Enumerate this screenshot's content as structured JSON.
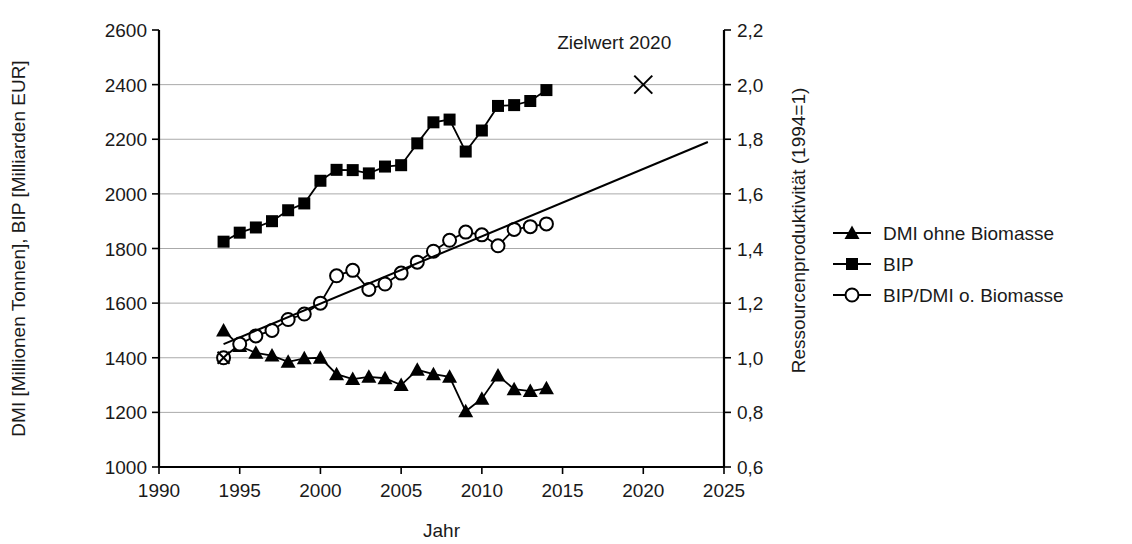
{
  "chart_data": {
    "type": "line",
    "title": "",
    "xlabel": "Jahr",
    "ylabel_left": "DMI [Millionen Tonnen], BIP [Milliarden EUR]",
    "ylabel_right": "Ressourcenproduktivität (1994=1)",
    "xlim": [
      1990,
      2025
    ],
    "xticks": [
      1990,
      1995,
      2000,
      2005,
      2010,
      2015,
      2020,
      2025
    ],
    "xtick_labels": [
      "1990",
      "1995",
      "2000",
      "2005",
      "2010",
      "2015",
      "2020",
      "2025"
    ],
    "ylim_left": [
      1000,
      2600
    ],
    "yticks_left": [
      1000,
      1200,
      1400,
      1600,
      1800,
      2000,
      2200,
      2400,
      2600
    ],
    "ytick_labels_left": [
      "1000",
      "1200",
      "1400",
      "1600",
      "1800",
      "2000",
      "2200",
      "2400",
      "2600"
    ],
    "ylim_right": [
      0.6,
      2.2
    ],
    "yticks_right": [
      0.6,
      0.8,
      1.0,
      1.2,
      1.4,
      1.6,
      1.8,
      2.0,
      2.2
    ],
    "ytick_labels_right": [
      "0,6",
      "0,8",
      "1,0",
      "1,2",
      "1,4",
      "1,6",
      "1,8",
      "2,0",
      "2,2"
    ],
    "grid": true,
    "legend_position": "right",
    "x": [
      1994,
      1995,
      1996,
      1997,
      1998,
      1999,
      2000,
      2001,
      2002,
      2003,
      2004,
      2005,
      2006,
      2007,
      2008,
      2009,
      2010,
      2011,
      2012,
      2013,
      2014
    ],
    "series": [
      {
        "name": "DMI ohne Biomasse",
        "marker": "filled-triangle",
        "axis": "left",
        "values": [
          1500,
          1443,
          1418,
          1408,
          1385,
          1398,
          1400,
          1340,
          1322,
          1330,
          1325,
          1300,
          1356,
          1340,
          1330,
          1204,
          1250,
          1335,
          1285,
          1278,
          1288
        ]
      },
      {
        "name": "BIP",
        "marker": "filled-square",
        "axis": "left",
        "values": [
          1825,
          1858,
          1877,
          1900,
          1940,
          1965,
          2048,
          2088,
          2087,
          2075,
          2100,
          2105,
          2185,
          2262,
          2272,
          2155,
          2232,
          2322,
          2325,
          2340,
          2380
        ]
      },
      {
        "name": "BIP/DMI o. Biomasse",
        "marker": "open-circle",
        "axis": "right",
        "values": [
          1.0,
          1.05,
          1.08,
          1.1,
          1.14,
          1.16,
          1.2,
          1.3,
          1.32,
          1.25,
          1.27,
          1.31,
          1.35,
          1.39,
          1.43,
          1.46,
          1.45,
          1.41,
          1.47,
          1.48,
          1.49
        ]
      }
    ],
    "trendline": {
      "name": "trend",
      "x": [
        1994,
        2024
      ],
      "values_right": [
        1.05,
        1.79
      ]
    },
    "annotations": [
      {
        "label": "Zielwert 2020",
        "marker": "x-cross",
        "x": 2020,
        "value_right": 2.0,
        "label_x": 2018.2,
        "label_y_right": 2.13
      },
      {
        "label": "",
        "marker": "x-cross",
        "x": 1994,
        "value_left": 1400
      }
    ]
  },
  "legend": {
    "items": [
      {
        "label": "DMI ohne Biomasse",
        "marker": "filled-triangle"
      },
      {
        "label": "BIP",
        "marker": "filled-square"
      },
      {
        "label": "BIP/DMI o. Biomasse",
        "marker": "open-circle"
      }
    ]
  },
  "colors": {
    "series": "#000000",
    "grid": "#aaaaaa",
    "axis": "#000000",
    "text": "#1a1a1a",
    "background": "#ffffff"
  }
}
